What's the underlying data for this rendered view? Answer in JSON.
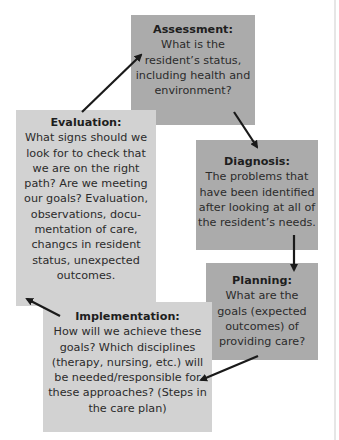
{
  "diagram": {
    "type": "cycle",
    "nodes": [
      {
        "id": "assessment",
        "title": "Assessment:",
        "text": "What is the resident’s status, including health and environment?",
        "color": "#ababab"
      },
      {
        "id": "diagnosis",
        "title": "Diagnosis:",
        "text": "The problems that have been identified after looking at all of the resident’s needs.",
        "color": "#ababab"
      },
      {
        "id": "planning",
        "title": "Planning:",
        "text": "What are the goals (expected outcomes) of providing care?",
        "color": "#ababab"
      },
      {
        "id": "implementation",
        "title": "Implementation:",
        "text": "How will we achieve these goals? Which disciplines (therapy, nursing, etc.) will be needed/responsible for these approaches? (Steps in the care plan)",
        "color": "#d2d2d2"
      },
      {
        "id": "evaluation",
        "title": "Evaluation:",
        "text": "What signs should we look for to check that we are on the right path? Are we meeting our goals? Evaluation, observations, docu-mentation of care, changcs in resident status, unexpected outcomes.",
        "color": "#d2d2d2"
      }
    ],
    "edges": [
      {
        "from": "assessment",
        "to": "diagnosis"
      },
      {
        "from": "diagnosis",
        "to": "planning"
      },
      {
        "from": "planning",
        "to": "implementation"
      },
      {
        "from": "implementation",
        "to": "evaluation"
      },
      {
        "from": "evaluation",
        "to": "assessment"
      }
    ]
  }
}
